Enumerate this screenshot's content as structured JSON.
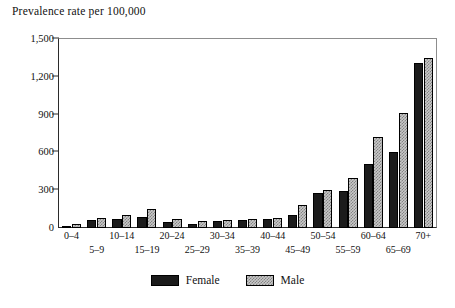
{
  "chart_data": {
    "type": "bar",
    "title": "Prevalence rate per 100,000",
    "xlabel": "",
    "ylabel": "",
    "ylim": [
      0,
      1500
    ],
    "yticks": [
      0,
      300,
      600,
      900,
      1200,
      1500
    ],
    "ytick_labels": [
      "0",
      "300",
      "600",
      "900",
      "1,200",
      "1,500"
    ],
    "grid": false,
    "legend_position": "bottom-center",
    "categories": [
      "0–4",
      "5–9",
      "10–14",
      "15–19",
      "20–24",
      "25–29",
      "30–34",
      "35–39",
      "40–44",
      "45–49",
      "50–54",
      "55–59",
      "60–64",
      "65–69",
      "70+"
    ],
    "series": [
      {
        "name": "Female",
        "color": "#1b1b1b",
        "values": [
          15,
          60,
          70,
          85,
          45,
          35,
          55,
          60,
          75,
          105,
          275,
          290,
          510,
          600,
          1310
        ]
      },
      {
        "name": "Male",
        "color": "#c8c8c8",
        "values": [
          30,
          80,
          105,
          150,
          75,
          55,
          65,
          70,
          80,
          180,
          300,
          395,
          720,
          910,
          1350
        ]
      }
    ]
  },
  "legend": {
    "entries": [
      {
        "label": "Female",
        "swatch": "black-filled-swatch"
      },
      {
        "label": "Male",
        "swatch": "gray-hatched-swatch"
      }
    ]
  }
}
